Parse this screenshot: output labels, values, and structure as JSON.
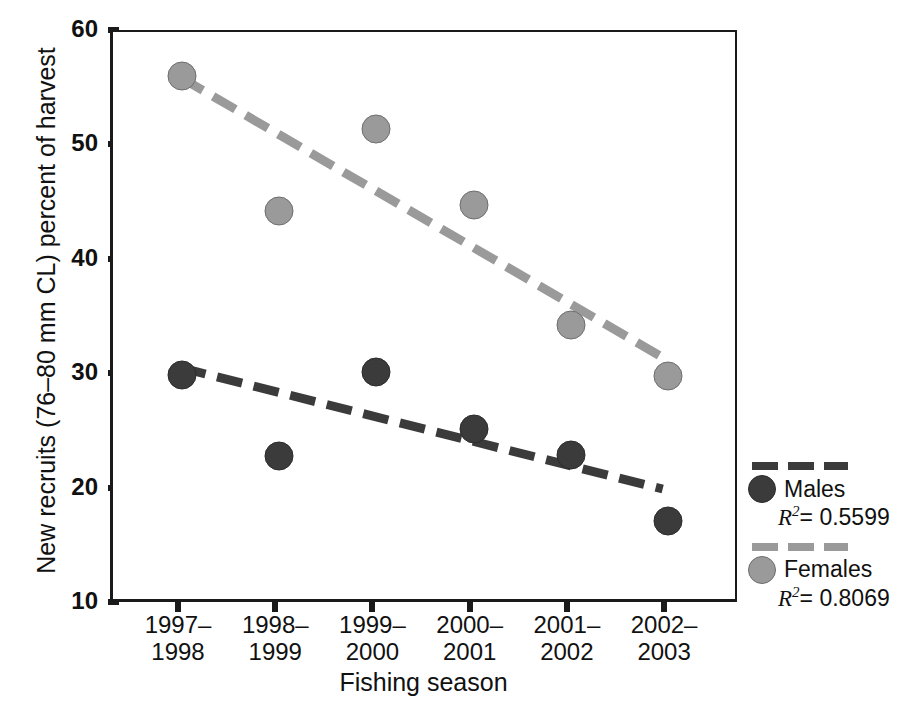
{
  "chart_data": {
    "type": "scatter",
    "title": "",
    "xlabel": "Fishing season",
    "ylabel": "New recruits (76–80 mm CL) percent of harvest",
    "categories": [
      "1997–1998",
      "1998–1999",
      "1999–2000",
      "2000–2001",
      "2001–2002",
      "2002–2003"
    ],
    "category_lines": [
      [
        "1997–",
        "1998"
      ],
      [
        "1998–",
        "1999"
      ],
      [
        "1999–",
        "2000"
      ],
      [
        "2000–",
        "2001"
      ],
      [
        "2001–",
        "2002"
      ],
      [
        "2002–",
        "2003"
      ]
    ],
    "ylim": [
      10,
      60
    ],
    "yticks": [
      60,
      50,
      40,
      30,
      20,
      10
    ],
    "grid": false,
    "legend_position": "right-outside",
    "series": [
      {
        "name": "Males",
        "color": "#3b3b3b",
        "r_squared": "0.5599",
        "values": [
          30.1,
          23.0,
          30.4,
          25.4,
          23.1,
          17.3
        ],
        "trendline": {
          "style": "dashed",
          "y_start": 30.4,
          "y_end": 19.7
        }
      },
      {
        "name": "Females",
        "color": "#9a9a9a",
        "r_squared": "0.8069",
        "values": [
          56.2,
          44.4,
          51.6,
          45.0,
          34.5,
          30.0
        ],
        "trendline": {
          "style": "dashed",
          "y_start": 56.0,
          "y_end": 31.3
        }
      }
    ]
  },
  "legend": {
    "males_label": "Males",
    "males_r2_symbol": "R",
    "males_r2_exponent": "2",
    "males_r2_value": "= 0.5599",
    "females_label": "Females",
    "females_r2_symbol": "R",
    "females_r2_exponent": "2",
    "females_r2_value": "= 0.8069"
  },
  "caption": {
    "text": ""
  }
}
